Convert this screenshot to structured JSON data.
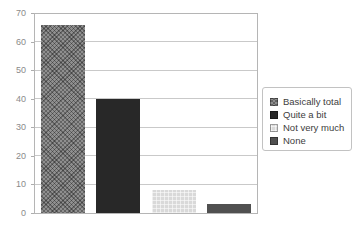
{
  "chart_data": {
    "type": "bar",
    "categories": [
      "Basically total",
      "Quite a bit",
      "Not very much",
      "None"
    ],
    "values": [
      66,
      40,
      8,
      3
    ],
    "title": "",
    "xlabel": "",
    "ylabel": "",
    "ylim": [
      0,
      70
    ],
    "ytick_interval": 10,
    "y_ticks": [
      "0",
      "10",
      "20",
      "30",
      "40",
      "50",
      "60",
      "70"
    ],
    "grid": true,
    "legend_position": "right",
    "bar_colors": [
      "#8f8f8f",
      "#282828",
      "#d9d9d9",
      "#505050"
    ],
    "bar_patterns": [
      "crosshatch",
      "solid",
      "grid",
      "solid"
    ]
  },
  "legend": {
    "items": [
      {
        "label": "Basically total",
        "color": "#8f8f8f",
        "pattern": "crosshatch"
      },
      {
        "label": "Quite a bit",
        "color": "#282828",
        "pattern": "solid"
      },
      {
        "label": "Not very much",
        "color": "#d9d9d9",
        "pattern": "grid"
      },
      {
        "label": "None",
        "color": "#505050",
        "pattern": "solid"
      }
    ]
  },
  "colors": {
    "plot_border": "#b5b5b5",
    "gridline": "#c9c9c9",
    "axis_label": "#8a8a8a",
    "legend_border": "#c2c2c2",
    "background": "#ffffff"
  }
}
